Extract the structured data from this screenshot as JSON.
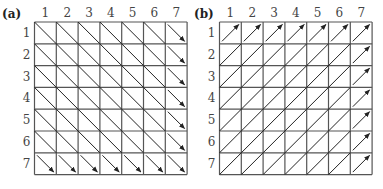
{
  "panels": [
    {
      "id": "a",
      "label": "(a)",
      "columns": [
        "1",
        "2",
        "3",
        "4",
        "5",
        "6",
        "7"
      ],
      "rows": [
        "1",
        "2",
        "3",
        "4",
        "5",
        "6",
        "7"
      ],
      "direction": "down-right",
      "arrowheads_on": "last column and last row cells"
    },
    {
      "id": "b",
      "label": "(b)",
      "columns": [
        "1",
        "2",
        "3",
        "4",
        "5",
        "6",
        "7"
      ],
      "rows": [
        "1",
        "2",
        "3",
        "4",
        "5",
        "6",
        "7"
      ],
      "direction": "up-right",
      "arrowheads_on": "first row and last column cells"
    }
  ],
  "colors": {
    "grid": "#555555",
    "diagonal": "#222222",
    "background": "#ffffff"
  }
}
